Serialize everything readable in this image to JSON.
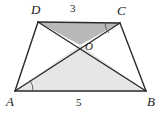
{
  "figure": {
    "type": "geometry-diagram",
    "shape": "trapezoid",
    "canvas": {
      "width": 162,
      "height": 114
    },
    "background_color": "#ffffff",
    "stroke_color": "#2b2b2b",
    "fill_top_triangle_color": "#b8b8b8",
    "fill_bottom_triangle_color": "#e6e6e6"
  },
  "vertices": {
    "D": {
      "label": "D",
      "x": 38,
      "y": 22
    },
    "C": {
      "label": "C",
      "x": 120,
      "y": 23
    },
    "A": {
      "label": "A",
      "x": 15,
      "y": 91
    },
    "B": {
      "label": "B",
      "x": 146,
      "y": 91
    },
    "O": {
      "label": "O",
      "x": 80,
      "y": 45
    }
  },
  "segments": [
    {
      "name": "DC",
      "from": "D",
      "to": "C"
    },
    {
      "name": "AB",
      "from": "A",
      "to": "B"
    },
    {
      "name": "AD",
      "from": "A",
      "to": "D"
    },
    {
      "name": "BC",
      "from": "B",
      "to": "C"
    },
    {
      "name": "AC",
      "from": "A",
      "to": "C"
    },
    {
      "name": "BD",
      "from": "B",
      "to": "D"
    }
  ],
  "measures": {
    "top_side": {
      "label": "3",
      "applies_to": "DC"
    },
    "bottom_side": {
      "label": "5",
      "applies_to": "AB"
    }
  },
  "angle_marks": [
    {
      "name": "angle-at-A",
      "vertex": "A",
      "between": "AB and AC"
    },
    {
      "name": "angle-at-C",
      "vertex": "C",
      "between": "CD and CA"
    }
  ],
  "shaded_regions": [
    {
      "name": "triangle-DOC",
      "vertices": [
        "D",
        "O",
        "C"
      ],
      "color": "#b8b8b8"
    },
    {
      "name": "triangle-AOB",
      "vertices": [
        "A",
        "O",
        "B"
      ],
      "color": "#e6e6e6"
    }
  ]
}
